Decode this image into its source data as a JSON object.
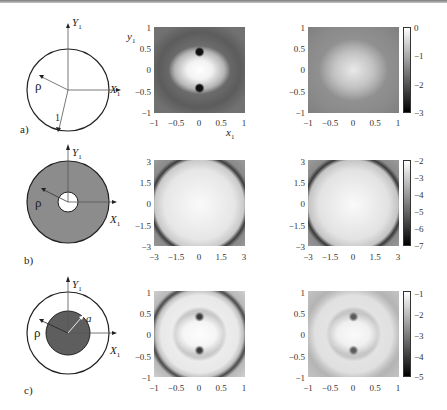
{
  "figure": {
    "rows": [
      {
        "label": "a)",
        "schematic": {
          "shape": "circle",
          "labels": {
            "x_axis": "X",
            "y_axis": "Y",
            "subscript": "1",
            "prime": "′",
            "rho": "ρ",
            "radius": "1"
          }
        },
        "plot_left": {
          "xlim": [
            -1,
            1
          ],
          "ylim": [
            -1,
            1
          ],
          "xticks": [
            "−1",
            "−0.5",
            "0",
            "0.5",
            "1"
          ],
          "yticks": [
            "1",
            "0.5",
            "0",
            "−0.5",
            "−1"
          ],
          "xlabel": "x",
          "ylabel": "y"
        },
        "plot_right": {
          "xlim": [
            -1,
            1
          ],
          "ylim": [
            -1,
            1
          ],
          "xticks": [
            "−1",
            "−0.5",
            "0",
            "0.5",
            "1"
          ],
          "yticks": [
            "1",
            "0.5",
            "0",
            "−0.5",
            "−1"
          ]
        },
        "colorbar": {
          "ticks": [
            "0",
            "−1",
            "−2",
            "−3"
          ],
          "range": [
            -3,
            0
          ]
        }
      },
      {
        "label": "b)",
        "schematic": {
          "shape": "annulus",
          "labels": {
            "x_axis": "X",
            "y_axis": "Y",
            "subscript": "1",
            "prime": "′",
            "rho": "ρ"
          }
        },
        "plot_left": {
          "xlim": [
            -3,
            3
          ],
          "ylim": [
            -3,
            3
          ],
          "xticks": [
            "−3",
            "−1.5",
            "0",
            "1.5",
            "3"
          ],
          "yticks": [
            "3",
            "1.5",
            "0",
            "−1.5",
            "−3"
          ]
        },
        "plot_right": {
          "xlim": [
            -3,
            3
          ],
          "ylim": [
            -3,
            3
          ],
          "xticks": [
            "−3",
            "−1.5",
            "0",
            "1.5",
            "3"
          ],
          "yticks": [
            "3",
            "1.5",
            "0",
            "−1.5",
            "−3"
          ]
        },
        "colorbar": {
          "ticks": [
            "−2",
            "−3",
            "−4",
            "−5",
            "−6",
            "−7"
          ],
          "range": [
            -7,
            -2
          ]
        }
      },
      {
        "label": "c)",
        "schematic": {
          "shape": "circle-with-inner-disk",
          "labels": {
            "x_axis": "X",
            "y_axis": "Y",
            "subscript": "1",
            "prime": "′",
            "rho": "ρ",
            "inner_radius": "a"
          }
        },
        "plot_left": {
          "xlim": [
            -1,
            1
          ],
          "ylim": [
            -1,
            1
          ],
          "xticks": [
            "−1",
            "−0.5",
            "0",
            "0.5",
            "1"
          ],
          "yticks": [
            "1",
            "0.5",
            "0",
            "−0.5",
            "−1"
          ]
        },
        "plot_right": {
          "xlim": [
            -1,
            1
          ],
          "ylim": [
            -1,
            1
          ],
          "xticks": [
            "−1",
            "−0.5",
            "0",
            "0.5",
            "1"
          ],
          "yticks": [
            "1",
            "0.5",
            "0",
            "−0.5",
            "−1"
          ]
        },
        "colorbar": {
          "ticks": [
            "−1",
            "−2",
            "−3",
            "−4",
            "−5"
          ],
          "range": [
            -5,
            -1
          ]
        }
      }
    ]
  }
}
